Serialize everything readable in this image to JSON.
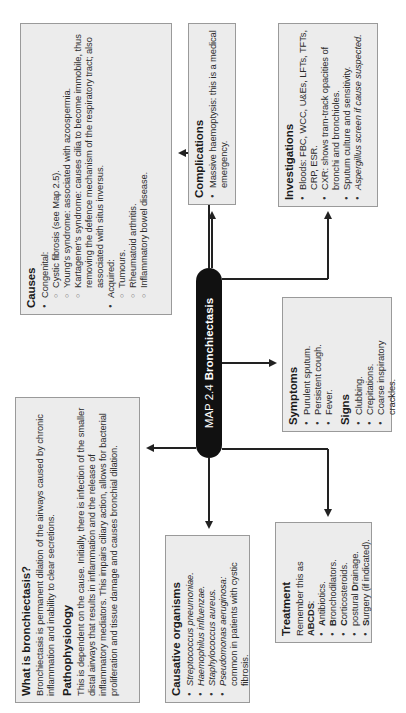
{
  "center": {
    "map_label": "MAP 2.4",
    "title": "Bronchiectasis"
  },
  "causes": {
    "heading": "Causes",
    "groups": [
      {
        "label": "Congenital:",
        "items": [
          "Cystic fibrosis (see Map 2.5).",
          "Young's syndrome: associated with azoospermia.",
          "Kartagener's syndrome: causes cilia to become immobile, thus removing the defence mechanism of the respiratory tract; also associated with situs inversus."
        ]
      },
      {
        "label": "Acquired:",
        "items": [
          "Tumours.",
          "Rheumatoid arthritis.",
          "Inflammatory bowel disease."
        ]
      }
    ]
  },
  "what_is": {
    "heading": "What is bronchiectasis?",
    "text": "Bronchiectasis is permanent dilation of the airways caused by chronic inflammation and inability to clear secretions.",
    "patho_heading": "Pathophysiology",
    "patho_text": "This is dependent on the cause. Initially, there is infection of the smaller distal airways that results in inflammation and the release of inflammatory mediators. This impairs ciliary action, allows for bacterial proliferation and tissue damage and causes bronchial dilation."
  },
  "complications": {
    "heading": "Complications",
    "items": [
      "Massive haemoptysis: this is a medical emergency."
    ]
  },
  "investigations": {
    "heading": "Investigations",
    "items": [
      "Bloods: FBC, WCC, U&Es, LFTs, TFTs, CRP, ESR.",
      "CXR: shows tram-track opacities of bronchi and bronchioles.",
      "Sputum culture and sensitivity.",
      "Aspergillus screen if cause suspected."
    ]
  },
  "symptoms": {
    "heading": "Symptoms",
    "items": [
      "Purulent sputum.",
      "Persistent cough.",
      "Fever."
    ],
    "signs_heading": "Signs",
    "signs": [
      "Clubbing.",
      "Crepitations.",
      "Coarse inspiratory crackles."
    ]
  },
  "organisms": {
    "heading": "Causative organisms",
    "items": [
      {
        "name": "Streptococcus pneumoniae.",
        "note": ""
      },
      {
        "name": "Haemophilus influenzae.",
        "note": ""
      },
      {
        "name": "Staphylococcus aureus.",
        "note": ""
      },
      {
        "name": "Pseudomonas aeruginosa:",
        "note": " common in patients with cystic fibrosis."
      }
    ]
  },
  "treatment": {
    "heading": "Treatment",
    "intro": "Remember this as ",
    "mnemonic": "ABCDS",
    "intro_end": ":",
    "items": [
      {
        "pre": "",
        "key": "A",
        "rest": "ntibiotics."
      },
      {
        "pre": "",
        "key": "B",
        "rest": "ronchodilators."
      },
      {
        "pre": "",
        "key": "C",
        "rest": "orticosteroids."
      },
      {
        "pre": "postural ",
        "key": "D",
        "rest": "rainage."
      },
      {
        "pre": "",
        "key": "S",
        "rest": "urgery (if indicated)."
      }
    ]
  },
  "colors": {
    "box_fill": "#ececec",
    "box_border": "#9a9a9a",
    "center_fill": "#111111",
    "line": "#222222"
  }
}
